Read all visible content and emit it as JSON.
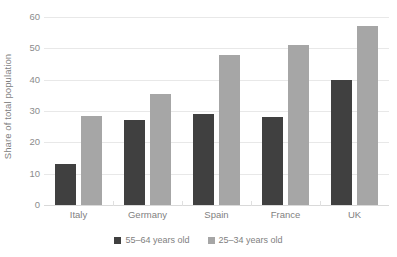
{
  "chart_data": {
    "type": "bar",
    "title": "",
    "subtitle": "",
    "xlabel": "",
    "ylabel": "Share of total population",
    "categories": [
      "Italy",
      "Germany",
      "Spain",
      "France",
      "UK"
    ],
    "series": [
      {
        "name": "55–64 years old",
        "color": "#404040",
        "values": [
          13,
          27,
          29,
          28,
          40
        ]
      },
      {
        "name": "25–34 years old",
        "color": "#a6a6a6",
        "values": [
          28.5,
          35.5,
          48,
          51,
          57
        ]
      }
    ],
    "ylim": [
      0,
      60
    ],
    "y_ticks": [
      0,
      10,
      20,
      30,
      40,
      50,
      60
    ],
    "y_tick_labels": [
      "0",
      "10",
      "20",
      "30",
      "40",
      "50",
      "60"
    ],
    "grid": "horizontal",
    "legend_position": "bottom-center"
  },
  "legend": {
    "items": [
      {
        "label": "55–64 years old",
        "marker": "square-marker-dark"
      },
      {
        "label": "25–34 years old",
        "marker": "square-marker-light"
      }
    ]
  }
}
